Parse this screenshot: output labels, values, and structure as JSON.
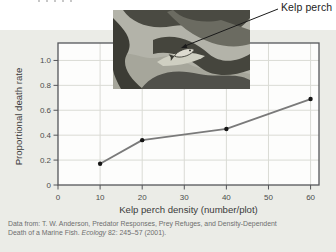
{
  "annotation": {
    "label": "Kelp perch"
  },
  "chart_data": {
    "type": "line",
    "title": "",
    "xlabel": "Kelp perch density (number/plot)",
    "ylabel": "Proportional death rate",
    "series": [
      {
        "name": "Proportional death rate",
        "x": [
          10,
          20,
          40,
          60
        ],
        "y": [
          0.17,
          0.36,
          0.45,
          0.69
        ]
      }
    ],
    "xlim": [
      0,
      62
    ],
    "ylim": [
      0,
      1.14
    ],
    "xticks": [
      0,
      10,
      20,
      30,
      40,
      50,
      60
    ],
    "xtick_labels": [
      "0",
      "10",
      "20",
      "30",
      "40",
      "50",
      "60"
    ],
    "yticks": [
      0,
      0.2,
      0.4,
      0.6,
      0.8,
      1.0
    ],
    "ytick_labels": [
      "0",
      "0.2",
      "0.4",
      "0.6",
      "0.8",
      "1.0"
    ],
    "grid": true,
    "legend": false,
    "line_color": "#7a7a7a",
    "marker_color": "#161616",
    "grid_color": "#dadbd5",
    "border_color": "#55565a",
    "tick_text_color": "#4c4c4c",
    "plot_bg": "#fdfdfc"
  },
  "citation": {
    "line1": "Data from: T. W. Anderson, Predator Responses, Prey Refuges, and Density-Dependent",
    "line2_prefix": "Death of a Marine Fish. ",
    "line2_italic": "Ecology",
    "line2_suffix": " 82: 245–57 (2001)."
  },
  "colors": {
    "panel_bg": "#ebece7",
    "label_text": "#3b3b3b",
    "muted_text": "#6e6e6e"
  }
}
